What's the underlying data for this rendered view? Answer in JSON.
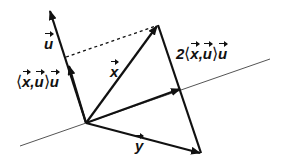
{
  "diagram": {
    "labels": {
      "u": "u",
      "x": "x",
      "y": "y",
      "proj_coef": "2",
      "lang": "⟨",
      "rang": "⟩",
      "comma": ","
    },
    "points": {
      "origin": [
        86,
        123
      ],
      "u_tip": [
        50,
        11
      ],
      "proj_tip": [
        69,
        65
      ],
      "x_tip": [
        158,
        25
      ],
      "y_tip": [
        201,
        153
      ],
      "line_proj": [
        181,
        88
      ],
      "dotted_start": [
        66,
        57
      ],
      "plane_start": [
        20,
        146
      ],
      "plane_end": [
        270,
        59
      ]
    },
    "colors": {
      "stroke": "#111111",
      "plane": "#555555",
      "background": "#ffffff"
    }
  }
}
